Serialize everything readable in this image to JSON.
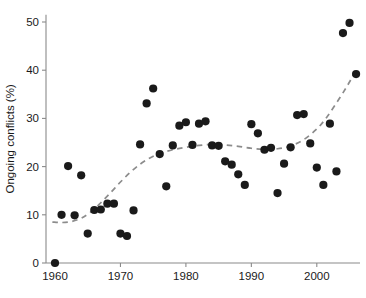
{
  "chart_data": {
    "type": "scatter",
    "title": "",
    "xlabel": "",
    "ylabel": "Ongoing conflicts (%)",
    "xlim": [
      1958.5,
      2007.5
    ],
    "ylim": [
      -1.5,
      52
    ],
    "grid": false,
    "legend": null,
    "x_ticks": [
      1960,
      1970,
      1980,
      1990,
      2000
    ],
    "x_tick_labels": [
      "1960",
      "1970",
      "1980",
      "1990",
      "2000"
    ],
    "y_ticks": [
      0,
      10,
      20,
      30,
      40,
      50
    ],
    "y_tick_labels": [
      "0",
      "10",
      "20",
      "30",
      "40",
      "50"
    ],
    "marker": {
      "shape": "circle",
      "color": "#1a1a1a",
      "size": 4.1
    },
    "points": [
      {
        "x": 1960,
        "y": 0.0
      },
      {
        "x": 1961,
        "y": 10.0
      },
      {
        "x": 1962,
        "y": 20.1
      },
      {
        "x": 1963,
        "y": 9.9
      },
      {
        "x": 1964,
        "y": 18.2
      },
      {
        "x": 1965,
        "y": 6.1
      },
      {
        "x": 1966,
        "y": 11.0
      },
      {
        "x": 1967,
        "y": 11.1
      },
      {
        "x": 1968,
        "y": 12.3
      },
      {
        "x": 1969,
        "y": 12.3
      },
      {
        "x": 1970,
        "y": 6.1
      },
      {
        "x": 1971,
        "y": 5.6
      },
      {
        "x": 1972,
        "y": 10.9
      },
      {
        "x": 1973,
        "y": 24.6
      },
      {
        "x": 1974,
        "y": 33.1
      },
      {
        "x": 1975,
        "y": 36.2
      },
      {
        "x": 1976,
        "y": 22.6
      },
      {
        "x": 1977,
        "y": 15.9
      },
      {
        "x": 1978,
        "y": 24.4
      },
      {
        "x": 1979,
        "y": 28.5
      },
      {
        "x": 1980,
        "y": 29.2
      },
      {
        "x": 1981,
        "y": 24.5
      },
      {
        "x": 1982,
        "y": 28.9
      },
      {
        "x": 1983,
        "y": 29.4
      },
      {
        "x": 1984,
        "y": 24.4
      },
      {
        "x": 1985,
        "y": 24.3
      },
      {
        "x": 1986,
        "y": 21.1
      },
      {
        "x": 1987,
        "y": 20.4
      },
      {
        "x": 1988,
        "y": 18.4
      },
      {
        "x": 1989,
        "y": 16.2
      },
      {
        "x": 1990,
        "y": 28.8
      },
      {
        "x": 1991,
        "y": 26.9
      },
      {
        "x": 1992,
        "y": 23.5
      },
      {
        "x": 1993,
        "y": 23.9
      },
      {
        "x": 1994,
        "y": 14.5
      },
      {
        "x": 1995,
        "y": 20.6
      },
      {
        "x": 1996,
        "y": 24.0
      },
      {
        "x": 1997,
        "y": 30.7
      },
      {
        "x": 1998,
        "y": 30.9
      },
      {
        "x": 1999,
        "y": 24.8
      },
      {
        "x": 2000,
        "y": 19.8
      },
      {
        "x": 2001,
        "y": 16.2
      },
      {
        "x": 2002,
        "y": 28.9
      },
      {
        "x": 2003,
        "y": 19.0
      },
      {
        "x": 2004,
        "y": 47.7
      },
      {
        "x": 2005,
        "y": 49.8
      },
      {
        "x": 2006,
        "y": 39.2
      }
    ],
    "trend_line": {
      "style": "dashed",
      "color": "#8c8c8c",
      "points": [
        {
          "x": 1959.6,
          "y": 8.5
        },
        {
          "x": 1961.0,
          "y": 8.4
        },
        {
          "x": 1962.5,
          "y": 8.6
        },
        {
          "x": 1964.0,
          "y": 9.3
        },
        {
          "x": 1965.5,
          "y": 10.6
        },
        {
          "x": 1967.0,
          "y": 12.5
        },
        {
          "x": 1968.5,
          "y": 14.6
        },
        {
          "x": 1970.0,
          "y": 16.8
        },
        {
          "x": 1971.5,
          "y": 18.8
        },
        {
          "x": 1973.0,
          "y": 20.5
        },
        {
          "x": 1974.5,
          "y": 21.8
        },
        {
          "x": 1976.0,
          "y": 22.7
        },
        {
          "x": 1978.0,
          "y": 23.5
        },
        {
          "x": 1980.0,
          "y": 24.0
        },
        {
          "x": 1982.0,
          "y": 24.4
        },
        {
          "x": 1984.0,
          "y": 24.6
        },
        {
          "x": 1986.0,
          "y": 24.5
        },
        {
          "x": 1988.0,
          "y": 24.2
        },
        {
          "x": 1990.0,
          "y": 23.8
        },
        {
          "x": 1992.0,
          "y": 23.6
        },
        {
          "x": 1994.0,
          "y": 23.7
        },
        {
          "x": 1996.0,
          "y": 24.3
        },
        {
          "x": 1998.0,
          "y": 25.6
        },
        {
          "x": 2000.0,
          "y": 27.8
        },
        {
          "x": 2001.5,
          "y": 30.2
        },
        {
          "x": 2003.0,
          "y": 33.2
        },
        {
          "x": 2004.5,
          "y": 36.4
        },
        {
          "x": 2005.6,
          "y": 39.0
        }
      ]
    }
  },
  "caption": {
    "fragment": ""
  }
}
